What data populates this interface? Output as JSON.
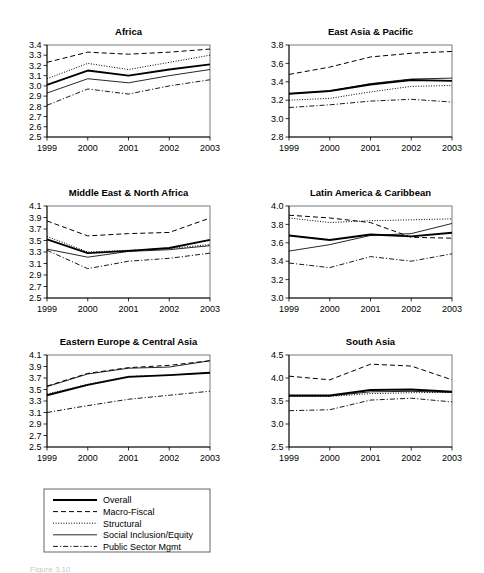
{
  "figure": {
    "caption": "Figure 3.10",
    "legend": {
      "entries": [
        {
          "label": "Overall",
          "style": "solid-thick"
        },
        {
          "label": "Macro-Fiscal",
          "style": "dashed"
        },
        {
          "label": "Structural",
          "style": "dotted"
        },
        {
          "label": "Social Inclusion/Equity",
          "style": "solid-thin"
        },
        {
          "label": "Public Sector Mgmt",
          "style": "dash-dot"
        }
      ]
    }
  },
  "chart_data": [
    {
      "type": "line",
      "title": "Africa",
      "xlabel": "",
      "ylabel": "",
      "x": [
        "1999",
        "2000",
        "2001",
        "2002",
        "2003"
      ],
      "ylim": [
        2.5,
        3.4
      ],
      "yticks": [
        "2.5",
        "2.6",
        "2.7",
        "2.8",
        "2.9",
        "3.0",
        "3.1",
        "3.2",
        "3.3",
        "3.4"
      ],
      "grid": false,
      "legend_position": "external-below",
      "series": [
        {
          "name": "Overall",
          "values": [
            3.01,
            3.15,
            3.1,
            3.16,
            3.21
          ]
        },
        {
          "name": "Macro-Fiscal",
          "values": [
            3.23,
            3.33,
            3.31,
            3.33,
            3.36
          ]
        },
        {
          "name": "Structural",
          "values": [
            3.07,
            3.22,
            3.16,
            3.23,
            3.3
          ]
        },
        {
          "name": "Social Inclusion/Equity",
          "values": [
            2.93,
            3.07,
            3.03,
            3.1,
            3.16
          ]
        },
        {
          "name": "Public Sector Mgmt",
          "values": [
            2.81,
            2.97,
            2.92,
            3.0,
            3.06
          ]
        }
      ]
    },
    {
      "type": "line",
      "title": "East Asia & Pacific",
      "xlabel": "",
      "ylabel": "",
      "x": [
        "1999",
        "2000",
        "2001",
        "2002",
        "2003"
      ],
      "ylim": [
        2.8,
        3.8
      ],
      "yticks": [
        "2.8",
        "3.0",
        "3.2",
        "3.4",
        "3.6",
        "3.8"
      ],
      "grid": false,
      "legend_position": "external-below",
      "series": [
        {
          "name": "Overall",
          "values": [
            3.27,
            3.3,
            3.37,
            3.42,
            3.41
          ]
        },
        {
          "name": "Macro-Fiscal",
          "values": [
            3.48,
            3.56,
            3.67,
            3.71,
            3.73
          ]
        },
        {
          "name": "Structural",
          "values": [
            3.2,
            3.22,
            3.29,
            3.35,
            3.36
          ]
        },
        {
          "name": "Social Inclusion/Equity",
          "values": [
            3.27,
            3.3,
            3.38,
            3.43,
            3.44
          ]
        },
        {
          "name": "Public Sector Mgmt",
          "values": [
            3.12,
            3.15,
            3.19,
            3.21,
            3.18
          ]
        }
      ]
    },
    {
      "type": "line",
      "title": "Middle East & North Africa",
      "xlabel": "",
      "ylabel": "",
      "x": [
        "1999",
        "2000",
        "2001",
        "2002",
        "2003"
      ],
      "ylim": [
        2.5,
        4.1
      ],
      "yticks": [
        "2.5",
        "2.7",
        "2.9",
        "3.1",
        "3.3",
        "3.5",
        "3.7",
        "3.9",
        "4.1"
      ],
      "grid": false,
      "legend_position": "external-below",
      "series": [
        {
          "name": "Overall",
          "values": [
            3.52,
            3.28,
            3.32,
            3.37,
            3.51
          ]
        },
        {
          "name": "Macro-Fiscal",
          "values": [
            3.84,
            3.58,
            3.62,
            3.64,
            3.89
          ]
        },
        {
          "name": "Structural",
          "values": [
            3.57,
            3.3,
            3.33,
            3.36,
            3.43
          ]
        },
        {
          "name": "Social Inclusion/Equity",
          "values": [
            3.35,
            3.21,
            3.31,
            3.34,
            3.41
          ]
        },
        {
          "name": "Public Sector Mgmt",
          "values": [
            3.33,
            3.01,
            3.14,
            3.19,
            3.28
          ]
        }
      ]
    },
    {
      "type": "line",
      "title": "Latin America & Caribbean",
      "xlabel": "",
      "ylabel": "",
      "x": [
        "1999",
        "2000",
        "2001",
        "2002",
        "2003"
      ],
      "ylim": [
        3.0,
        4.0
      ],
      "yticks": [
        "3.0",
        "3.2",
        "3.4",
        "3.6",
        "3.8",
        "4.0"
      ],
      "grid": false,
      "legend_position": "external-below",
      "series": [
        {
          "name": "Overall",
          "values": [
            3.68,
            3.63,
            3.69,
            3.67,
            3.71
          ]
        },
        {
          "name": "Macro-Fiscal",
          "values": [
            3.9,
            3.87,
            3.82,
            3.66,
            3.65
          ]
        },
        {
          "name": "Structural",
          "values": [
            3.87,
            3.82,
            3.84,
            3.85,
            3.86
          ]
        },
        {
          "name": "Social Inclusion/Equity",
          "values": [
            3.51,
            3.58,
            3.68,
            3.7,
            3.81
          ]
        },
        {
          "name": "Public Sector Mgmt",
          "values": [
            3.38,
            3.33,
            3.45,
            3.4,
            3.48
          ]
        }
      ]
    },
    {
      "type": "line",
      "title": "Eastern Europe & Central Asia",
      "xlabel": "",
      "ylabel": "",
      "x": [
        "1999",
        "2000",
        "2001",
        "2002",
        "2003"
      ],
      "ylim": [
        2.5,
        4.1
      ],
      "yticks": [
        "2.5",
        "2.7",
        "2.9",
        "3.1",
        "3.3",
        "3.5",
        "3.7",
        "3.9",
        "4.1"
      ],
      "grid": false,
      "legend_position": "external-below",
      "series": [
        {
          "name": "Overall",
          "values": [
            3.4,
            3.58,
            3.72,
            3.75,
            3.79
          ]
        },
        {
          "name": "Macro-Fiscal",
          "values": [
            3.56,
            3.78,
            3.88,
            3.92,
            4.0
          ]
        },
        {
          "name": "Structural",
          "values": [
            3.42,
            3.59,
            3.73,
            3.75,
            3.79
          ]
        },
        {
          "name": "Social Inclusion/Equity",
          "values": [
            3.55,
            3.77,
            3.87,
            3.89,
            4.0
          ]
        },
        {
          "name": "Public Sector Mgmt",
          "values": [
            3.1,
            3.22,
            3.33,
            3.4,
            3.47
          ]
        }
      ]
    },
    {
      "type": "line",
      "title": "South Asia",
      "xlabel": "",
      "ylabel": "",
      "x": [
        "1999",
        "2000",
        "2001",
        "2002",
        "2003"
      ],
      "ylim": [
        2.5,
        4.5
      ],
      "yticks": [
        "2.5",
        "3.0",
        "3.5",
        "4.0",
        "4.5"
      ],
      "grid": false,
      "legend_position": "external-below",
      "series": [
        {
          "name": "Overall",
          "values": [
            3.62,
            3.62,
            3.74,
            3.75,
            3.7
          ]
        },
        {
          "name": "Macro-Fiscal",
          "values": [
            4.04,
            3.96,
            4.3,
            4.26,
            3.96
          ]
        },
        {
          "name": "Structural",
          "values": [
            3.6,
            3.6,
            3.66,
            3.68,
            3.69
          ]
        },
        {
          "name": "Social Inclusion/Equity",
          "values": [
            3.61,
            3.61,
            3.7,
            3.71,
            3.69
          ]
        },
        {
          "name": "Public Sector Mgmt",
          "values": [
            3.29,
            3.31,
            3.52,
            3.56,
            3.48
          ]
        }
      ]
    }
  ]
}
